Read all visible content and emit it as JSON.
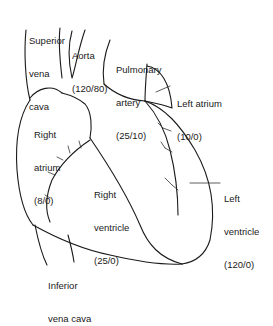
{
  "diagram": {
    "labels": [
      {
        "id": "superior-vena-cava",
        "lines": [
          "Superior",
          "vena",
          "cava"
        ]
      },
      {
        "id": "aorta",
        "lines": [
          "Aorta",
          "(120/80)"
        ]
      },
      {
        "id": "pulmonary-artery",
        "lines": [
          "Pulmonary",
          "artery",
          "(25/10)"
        ]
      },
      {
        "id": "left-atrium",
        "lines": [
          "Left atrium",
          "(10/0)"
        ]
      },
      {
        "id": "right-atrium",
        "lines": [
          "Right",
          "atrium",
          "(8/0)"
        ]
      },
      {
        "id": "right-ventricle",
        "lines": [
          "Right",
          "ventricle",
          "(25/0)"
        ]
      },
      {
        "id": "left-ventricle",
        "lines": [
          "Left",
          "ventricle",
          "(120/0)"
        ]
      },
      {
        "id": "inferior-vena-cava",
        "lines": [
          "Inferior",
          "vena cava"
        ]
      }
    ],
    "line_color": "#1a1a1a",
    "background": "#ffffff"
  }
}
